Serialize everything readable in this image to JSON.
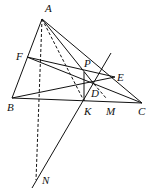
{
  "diagram": {
    "type": "geometry",
    "points": {
      "A": {
        "label": "A",
        "x": 42,
        "y": 19
      },
      "B": {
        "label": "B",
        "x": 12,
        "y": 98
      },
      "C": {
        "label": "C",
        "x": 142,
        "y": 103
      },
      "D": {
        "label": "D",
        "x": 94,
        "y": 84
      },
      "E": {
        "label": "E",
        "x": 115,
        "y": 77
      },
      "F": {
        "label": "F",
        "x": 27,
        "y": 57
      },
      "K": {
        "label": "K",
        "x": 84,
        "y": 101
      },
      "M": {
        "label": "M",
        "x": 108,
        "y": 100
      },
      "N": {
        "label": "N",
        "x": 36,
        "y": 178
      },
      "P": {
        "label": "P",
        "x": 84,
        "y": 72
      }
    },
    "labels": [
      "A",
      "B",
      "C",
      "D",
      "E",
      "F",
      "K",
      "M",
      "N",
      "P"
    ]
  }
}
